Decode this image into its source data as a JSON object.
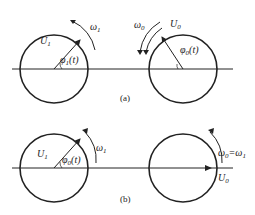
{
  "panel_a": {
    "caption": "(a)",
    "left_circle": {
      "voltage_label": "U",
      "voltage_sub": "1",
      "angle_label": "φ",
      "angle_sub": "1",
      "angle_arg": "(t)",
      "omega_label": "ω",
      "omega_sub": "1"
    },
    "right_circle": {
      "voltage_label": "U",
      "voltage_sub": "0",
      "angle_label": "φ",
      "angle_sub": "0",
      "angle_arg": "(t)",
      "omega_label": "ω",
      "omega_sub": "0"
    }
  },
  "panel_b": {
    "caption": "(b)",
    "left_circle": {
      "voltage_label": "U",
      "voltage_sub": "1",
      "angle_label": "φ",
      "angle_sub": "0",
      "angle_arg": "(t)",
      "omega_label": "ω",
      "omega_sub": "1"
    },
    "right_circle": {
      "voltage_label": "U",
      "voltage_sub": "0",
      "omega_eq_label": "ω",
      "omega_eq_sub": "0",
      "omega_eq_rhs": "=ω",
      "omega_eq_rhs_sub": "1"
    }
  },
  "colors": {
    "stroke": "#222222",
    "background": "#ffffff"
  }
}
